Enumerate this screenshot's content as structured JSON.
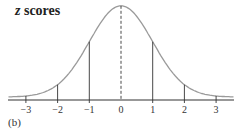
{
  "chart_data": {
    "type": "line",
    "title": "z scores",
    "panel_label": "(b)",
    "xlabel": "",
    "ylabel": "",
    "x_ticks": [
      -3,
      -2,
      -1,
      0,
      1,
      2,
      3
    ],
    "tick_labels": [
      "−3",
      "−2",
      "−1",
      "0",
      "1",
      "2",
      "3"
    ],
    "curve": "standard normal density",
    "x": [
      -3.4,
      -3,
      -2,
      -1,
      0,
      1,
      2,
      3,
      3.4
    ],
    "y": [
      0.0012,
      0.0044,
      0.054,
      0.242,
      0.399,
      0.242,
      0.054,
      0.0044,
      0.0012
    ],
    "vertical_lines_at": [
      -3,
      -2,
      -1,
      1,
      2,
      3
    ],
    "dashed_line_at": 0,
    "grid": false,
    "legend": null
  },
  "colors": {
    "curve": "#9a9a9a",
    "lines": "#333333",
    "axis": "#333333"
  }
}
